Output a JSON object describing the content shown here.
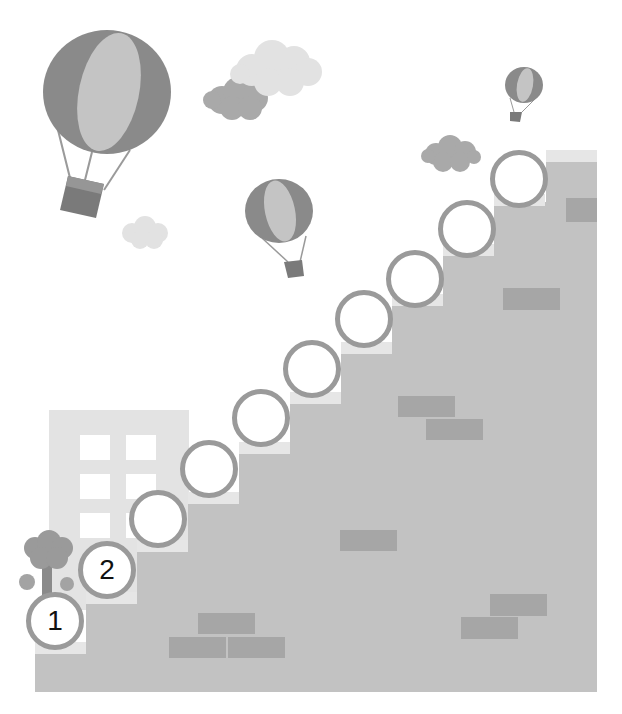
{
  "worksheet": {
    "title": "Number staircase",
    "steps": [
      {
        "index": 1,
        "label": "1"
      },
      {
        "index": 2,
        "label": "2"
      },
      {
        "index": 3,
        "label": ""
      },
      {
        "index": 4,
        "label": ""
      },
      {
        "index": 5,
        "label": ""
      },
      {
        "index": 6,
        "label": ""
      },
      {
        "index": 7,
        "label": ""
      },
      {
        "index": 8,
        "label": ""
      },
      {
        "index": 9,
        "label": ""
      },
      {
        "index": 10,
        "label": ""
      }
    ]
  },
  "decorations": {
    "balloons": [
      "large-balloon",
      "medium-balloon",
      "small-balloon"
    ],
    "clouds": [
      "cloud-light",
      "cloud-dark",
      "cloud-small",
      "cloud-right"
    ],
    "building": "building",
    "tree": "tree"
  },
  "colors": {
    "wall": "#c2c2c2",
    "tread": "#e6e6e6",
    "brick": "#a6a6a6",
    "ring": "#9a9a9a",
    "building": "#e3e3e3",
    "balloon_dark": "#8a8a8a",
    "balloon_light": "#c4c4c4",
    "cloud_dark": "#a9a9a9",
    "cloud_light": "#e2e2e2"
  }
}
